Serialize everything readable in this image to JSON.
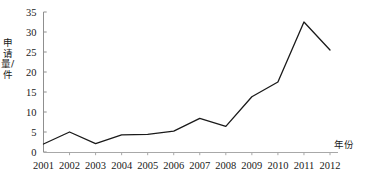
{
  "chart_data": {
    "type": "line",
    "title": "",
    "xlabel": "年份",
    "ylabel": "申请量/件",
    "x": [
      2001,
      2002,
      2003,
      2004,
      2005,
      2006,
      2007,
      2008,
      2009,
      2010,
      2011,
      2012
    ],
    "categories": [
      "2001",
      "2002",
      "2003",
      "2004",
      "2005",
      "2006",
      "2007",
      "2008",
      "2009",
      "2010",
      "2011",
      "2012"
    ],
    "values": [
      2.0,
      5.0,
      2.1,
      4.3,
      4.4,
      5.2,
      8.4,
      6.4,
      13.8,
      17.5,
      32.5,
      25.5
    ],
    "series": [
      {
        "name": "申请量",
        "values": [
          2.0,
          5.0,
          2.1,
          4.3,
          4.4,
          5.2,
          8.4,
          6.4,
          13.8,
          17.5,
          32.5,
          25.5
        ]
      }
    ],
    "ylim": [
      0,
      35
    ],
    "yticks": [
      0,
      5,
      10,
      15,
      20,
      25,
      30,
      35
    ],
    "ytick_labels": [
      "0",
      "5",
      "10",
      "15",
      "20",
      "25",
      "30",
      "35"
    ],
    "xtick_labels": [
      "2001",
      "2002",
      "2003",
      "2004",
      "2005",
      "2006",
      "2007",
      "2008",
      "2009",
      "2010",
      "2011",
      "2012"
    ],
    "grid": false,
    "legend": null,
    "legend_position": "none",
    "line_color": "#1a1a1a",
    "axis_color": "#9a9a9a",
    "background_color": "#ffffff",
    "markers": false
  },
  "axes": {
    "y_axis_title": "申请量/件",
    "x_axis_title": "年份"
  }
}
